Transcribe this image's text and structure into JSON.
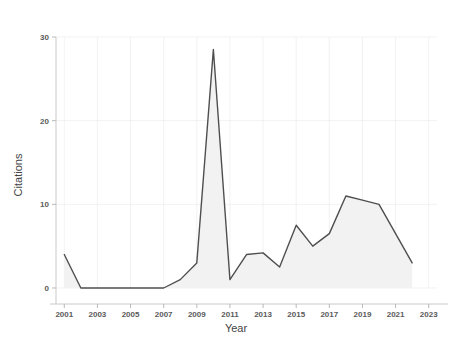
{
  "chart_data": {
    "type": "area",
    "title": "",
    "subtitle": "",
    "xlabel": "Year",
    "ylabel": "Citations",
    "x": [
      2001,
      2002,
      2003,
      2004,
      2005,
      2006,
      2007,
      2008,
      2009,
      2010,
      2011,
      2012,
      2013,
      2014,
      2015,
      2016,
      2017,
      2018,
      2019,
      2020,
      2021,
      2022
    ],
    "values": [
      4,
      0,
      0,
      0,
      0,
      0,
      0,
      1,
      3,
      28.5,
      1,
      4,
      4.2,
      2.5,
      7.5,
      5,
      6.5,
      11,
      10.5,
      10,
      6.5,
      3
    ],
    "series": [
      {
        "name": "Citations",
        "values": [
          4,
          0,
          0,
          0,
          0,
          0,
          0,
          1,
          3,
          28.5,
          1,
          4,
          4.2,
          2.5,
          7.5,
          5,
          6.5,
          11,
          10.5,
          10,
          6.5,
          3
        ]
      }
    ],
    "xlim": [
      2000.5,
      2023.5
    ],
    "ylim": [
      0,
      30
    ],
    "xticks": [
      2001,
      2003,
      2005,
      2007,
      2009,
      2011,
      2013,
      2015,
      2017,
      2019,
      2021,
      2023
    ],
    "xtick_labels": [
      "2001",
      "2003",
      "2005",
      "2007",
      "2009",
      "2011",
      "2013",
      "2015",
      "2017",
      "2019",
      "2021",
      "2023"
    ],
    "yticks": [
      0,
      10,
      20,
      30
    ],
    "ytick_labels": [
      "0",
      "10",
      "20",
      "30"
    ],
    "grid": true,
    "legend": false,
    "legend_position": "none",
    "line_color": "#4f4f4f",
    "fill_color": "#f2f2f2",
    "background_color": "#ffffff",
    "grid_color": "#ededed",
    "axis_color": "#c9c9c9",
    "tick_text_color": "#5a5a5a",
    "axis_title_color": "#444444"
  }
}
